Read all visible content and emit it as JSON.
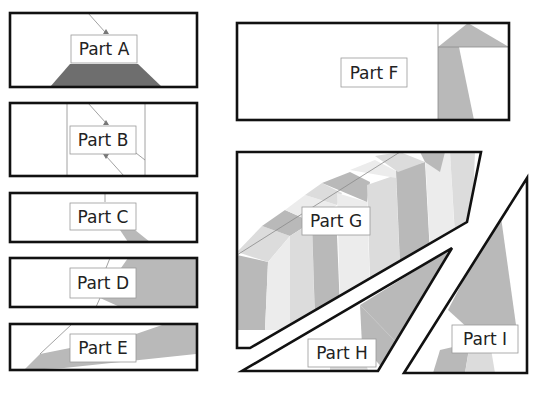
{
  "colors": {
    "outline": "#111111",
    "dark_fill": "#6f6f6f",
    "mid_fill": "#b9b9b9",
    "light_fill": "#dcdcdc",
    "lighter_fill": "#ececec",
    "background": "#ffffff"
  },
  "parts": [
    {
      "id": "A",
      "label": "Part A"
    },
    {
      "id": "B",
      "label": "Part B"
    },
    {
      "id": "C",
      "label": "Part C"
    },
    {
      "id": "D",
      "label": "Part D"
    },
    {
      "id": "E",
      "label": "Part E"
    },
    {
      "id": "F",
      "label": "Part F"
    },
    {
      "id": "G",
      "label": "Part G"
    },
    {
      "id": "H",
      "label": "Part H"
    },
    {
      "id": "I",
      "label": "Part I"
    }
  ]
}
